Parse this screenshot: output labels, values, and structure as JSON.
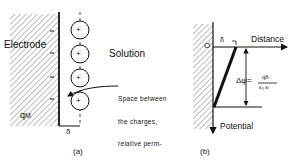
{
  "panel_a": {
    "electrode_label": "Electrode",
    "solution_label": "Solution",
    "charge_label_main": "q",
    "charge_label_sub": "M",
    "ion_sign": "+",
    "ion_count": 4,
    "electrode_charge_sign": "–",
    "gap_label": "δ",
    "annotation_lines": [
      "Space between",
      "the charges,",
      "relative perm-",
      "ittivity  ε"
    ],
    "annotation_sub": "r",
    "caption": "(a)"
  },
  "panel_b": {
    "origin_label": "O",
    "x_axis_label": "Distance",
    "y_axis_label": "Potential",
    "gap_label": "δ",
    "equation_lhs": "Δψ=",
    "equation_numerator": "qδ",
    "equation_denominator": "ε₀ εᵣ",
    "caption": "(b)"
  }
}
